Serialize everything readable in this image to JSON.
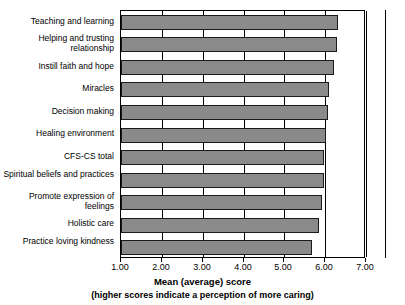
{
  "chart_data": {
    "type": "bar",
    "orientation": "horizontal",
    "title": "",
    "xlabel": "Mean (average) score",
    "xsublabel": "(higher scores indicate a perception of more caring)",
    "ylabel": "",
    "xlim": [
      1.0,
      7.0
    ],
    "xticks": [
      "1.00",
      "2.00",
      "3.00",
      "4.00",
      "5.00",
      "6.00",
      "7.00"
    ],
    "xtick_values": [
      1.0,
      2.0,
      3.0,
      4.0,
      5.0,
      6.0,
      7.0
    ],
    "grid": true,
    "legend": "none",
    "bar_color": "#8a8a8a",
    "bar_edge_color": "#1a1a1a",
    "categories": [
      "Teaching and learning",
      "Helping and trusting relationship",
      "Instill faith and hope",
      "Miracles",
      "Decision making",
      "Healing environment",
      "CFS-CS total",
      "Spiritual beliefs and practices",
      "Promote expression of feelings",
      "Holistic care",
      "Practice loving kindness"
    ],
    "values": [
      6.32,
      6.28,
      6.22,
      6.1,
      6.06,
      6.02,
      5.98,
      5.96,
      5.92,
      5.85,
      5.68
    ]
  }
}
